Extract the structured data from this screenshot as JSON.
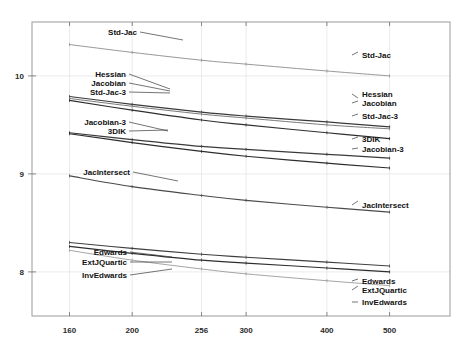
{
  "chart_data": {
    "type": "line",
    "title": "",
    "subtitle": "",
    "xlabel": "",
    "ylabel": "",
    "xscale": "log",
    "yscale": "linear",
    "grid": true,
    "legend_position": "inline-endpoint-labels",
    "xticks": [
      160,
      200,
      256,
      300,
      400,
      500
    ],
    "xticklabels": [
      "160",
      "200",
      "256",
      "300",
      "400",
      "500"
    ],
    "yticks": [
      10,
      9,
      8
    ],
    "yticklabels": [
      "10",
      "9",
      "8"
    ],
    "xlim": [
      140,
      620
    ],
    "ylim": [
      7.55,
      10.55
    ],
    "x": [
      160,
      200,
      256,
      300,
      400,
      500
    ],
    "series": [
      {
        "name": "Std-Jac",
        "color": "#8c8c8c",
        "width": 0.9,
        "values": [
          10.32,
          10.24,
          10.16,
          10.12,
          10.05,
          10.0
        ],
        "left_label": "Std-Jac",
        "right_label": "Std-Jac"
      },
      {
        "name": "Hessian",
        "color": "#3a3a3a",
        "width": 1.2,
        "values": [
          9.79,
          9.71,
          9.63,
          9.59,
          9.53,
          9.48
        ],
        "left_label": "Hessian",
        "right_label": "Hessian"
      },
      {
        "name": "Jacobian",
        "color": "#7a7a7a",
        "width": 1.0,
        "values": [
          9.77,
          9.69,
          9.61,
          9.57,
          9.5,
          9.46
        ],
        "left_label": "Jacobian",
        "right_label": "Jacobian"
      },
      {
        "name": "Std-Jac-3",
        "color": "#2e2e2e",
        "width": 1.2,
        "values": [
          9.75,
          9.65,
          9.55,
          9.5,
          9.42,
          9.36
        ],
        "left_label": "Std-Jac-3",
        "right_label": "Std-Jac-3"
      },
      {
        "name": "3DIK",
        "color": "#3a3a3a",
        "width": 1.2,
        "values": [
          9.42,
          9.35,
          9.28,
          9.25,
          9.2,
          9.16
        ],
        "left_label": "3DIK",
        "right_label": "3DIK"
      },
      {
        "name": "Jacobian-3",
        "color": "#2e2e2e",
        "width": 1.2,
        "values": [
          9.41,
          9.32,
          9.23,
          9.18,
          9.11,
          9.06
        ],
        "left_label": "Jacobian-3",
        "right_label": "Jacobian-3"
      },
      {
        "name": "JacIntersect",
        "color": "#4a4a4a",
        "width": 1.1,
        "values": [
          8.98,
          8.87,
          8.78,
          8.73,
          8.66,
          8.61
        ],
        "left_label": "JacIntersect",
        "right_label": "JacIntersect"
      },
      {
        "name": "Edwards",
        "color": "#3f3f3f",
        "width": 1.1,
        "values": [
          8.3,
          8.24,
          8.18,
          8.15,
          8.1,
          8.06
        ],
        "left_label": "Edwards",
        "right_label": "Edwards"
      },
      {
        "name": "ExtJQuartic",
        "color": "#2e2e2e",
        "width": 1.2,
        "values": [
          8.26,
          8.19,
          8.12,
          8.09,
          8.04,
          8.0
        ],
        "left_label": "ExtJQuartic",
        "right_label": "ExtJQuartic"
      },
      {
        "name": "InvEdwards",
        "color": "#9a9a9a",
        "width": 0.9,
        "values": [
          8.22,
          8.12,
          8.03,
          7.98,
          7.91,
          7.86
        ],
        "left_label": "InvEdwards",
        "right_label": "InvEdwards"
      }
    ],
    "left_annotations": [
      {
        "text": "Std-Jac",
        "x": 137,
        "y": 32,
        "anchor_x": 183,
        "anchor_y": 40
      },
      {
        "text": "Hessian",
        "x": 126,
        "y": 74,
        "anchor_x": 170,
        "anchor_y": 89
      },
      {
        "text": "Jacobian",
        "x": 126,
        "y": 83,
        "anchor_x": 170,
        "anchor_y": 91
      },
      {
        "text": "Std-Jac-3",
        "x": 126,
        "y": 92,
        "anchor_x": 170,
        "anchor_y": 93
      },
      {
        "text": "Jacobian-3",
        "x": 126,
        "y": 122,
        "anchor_x": 168,
        "anchor_y": 131
      },
      {
        "text": "3DIK",
        "x": 126,
        "y": 131,
        "anchor_x": 168,
        "anchor_y": 130
      },
      {
        "text": "JacIntersect",
        "x": 130,
        "y": 172,
        "anchor_x": 178,
        "anchor_y": 181
      },
      {
        "text": "Edwards",
        "x": 127,
        "y": 252,
        "anchor_x": 172,
        "anchor_y": 257
      },
      {
        "text": "ExtJQuartic",
        "x": 127,
        "y": 262,
        "anchor_x": 172,
        "anchor_y": 262
      },
      {
        "text": "InvEdwards",
        "x": 127,
        "y": 275,
        "anchor_x": 172,
        "anchor_y": 269
      }
    ],
    "right_annotations": [
      {
        "text": "Std-Jac",
        "x": 362,
        "y": 55,
        "anchor_x": 358,
        "anchor_y": 52
      },
      {
        "text": "Hessian",
        "x": 362,
        "y": 94,
        "anchor_x": 358,
        "anchor_y": 98
      },
      {
        "text": "Jacobian",
        "x": 362,
        "y": 103,
        "anchor_x": 358,
        "anchor_y": 101
      },
      {
        "text": "Std-Jac-3",
        "x": 362,
        "y": 116,
        "anchor_x": 358,
        "anchor_y": 114
      },
      {
        "text": "3DIK",
        "x": 362,
        "y": 139,
        "anchor_x": 358,
        "anchor_y": 137
      },
      {
        "text": "Jacobian-3",
        "x": 362,
        "y": 149,
        "anchor_x": 358,
        "anchor_y": 148
      },
      {
        "text": "JacIntersect",
        "x": 362,
        "y": 205,
        "anchor_x": 358,
        "anchor_y": 201
      },
      {
        "text": "Edwards",
        "x": 362,
        "y": 281,
        "anchor_x": 358,
        "anchor_y": 279
      },
      {
        "text": "ExtJQuartic",
        "x": 362,
        "y": 290,
        "anchor_x": 358,
        "anchor_y": 286
      },
      {
        "text": "InvEdwards",
        "x": 362,
        "y": 302,
        "anchor_x": 358,
        "anchor_y": 302
      }
    ]
  }
}
